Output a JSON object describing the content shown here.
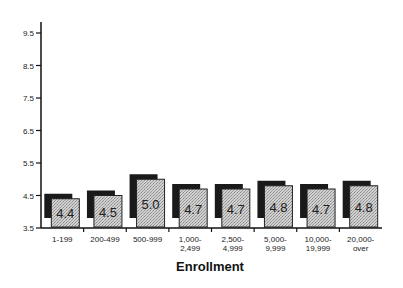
{
  "chart_data": {
    "type": "bar",
    "title": "",
    "xlabel": "Enrollment",
    "ylabel": "",
    "ylim": [
      3.5,
      9.5
    ],
    "yticks": [
      "3.5",
      "4.5",
      "5.5",
      "6.5",
      "7.5",
      "8.5",
      "9.5"
    ],
    "categories": [
      [
        "1-199"
      ],
      [
        "200-499"
      ],
      [
        "500-999"
      ],
      [
        "1,000-",
        "2,499"
      ],
      [
        "2,500-",
        "4,999"
      ],
      [
        "5,000-",
        "9,999"
      ],
      [
        "10,000-",
        "19,999"
      ],
      [
        "20,000-",
        "over"
      ]
    ],
    "values": [
      4.4,
      4.5,
      5.0,
      4.7,
      4.7,
      4.8,
      4.7,
      4.8
    ],
    "data_labels": [
      "4.4",
      "4.5",
      "5.0",
      "4.7",
      "4.7",
      "4.8",
      "4.7",
      "4.8"
    ],
    "grid": false,
    "legend": "none",
    "colors": {
      "bar_fill": "#c8c8c8",
      "bar_shadow": "#1a1a1a",
      "axis": "#111111"
    }
  }
}
